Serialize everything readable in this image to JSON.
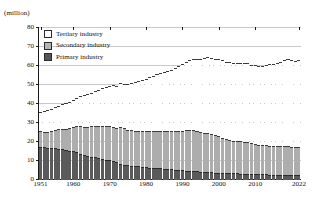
{
  "chart_data": {
    "type": "bar",
    "title": "",
    "subtitle": "",
    "xlabel": "",
    "ylabel": "(million)",
    "unit_label": "(million)",
    "stacked": true,
    "grid": true,
    "legend_position": "top-left",
    "ylim": [
      0,
      80
    ],
    "yticks": [
      0,
      10,
      20,
      30,
      40,
      50,
      60,
      70,
      80
    ],
    "xtick_labels": [
      "1951",
      "1960",
      "1970",
      "1980",
      "1990",
      "2000",
      "2010",
      "2022"
    ],
    "xtick_years": [
      1951,
      1960,
      1970,
      1980,
      1990,
      2000,
      2010,
      2022
    ],
    "xlim": [
      1951,
      2022
    ],
    "categories": [
      1951,
      1952,
      1953,
      1954,
      1955,
      1956,
      1957,
      1958,
      1959,
      1960,
      1961,
      1962,
      1963,
      1964,
      1965,
      1966,
      1967,
      1968,
      1969,
      1970,
      1971,
      1972,
      1973,
      1974,
      1975,
      1976,
      1977,
      1978,
      1979,
      1980,
      1981,
      1982,
      1983,
      1984,
      1985,
      1986,
      1987,
      1988,
      1989,
      1990,
      1991,
      1992,
      1993,
      1994,
      1995,
      1996,
      1997,
      1998,
      1999,
      2000,
      2001,
      2002,
      2003,
      2004,
      2005,
      2006,
      2007,
      2008,
      2009,
      2010,
      2011,
      2012,
      2013,
      2014,
      2015,
      2016,
      2017,
      2018,
      2019,
      2020,
      2021,
      2022
    ],
    "series": [
      {
        "name": "Primary industry",
        "color": "#5a5a5a",
        "values": [
          17.1,
          16.6,
          16.2,
          16.1,
          16.3,
          15.9,
          15.6,
          15.2,
          14.9,
          14.5,
          14.0,
          13.3,
          12.6,
          12.2,
          11.8,
          11.4,
          11.0,
          10.6,
          10.2,
          10.1,
          9.4,
          8.9,
          8.0,
          7.5,
          7.3,
          7.1,
          6.9,
          6.7,
          6.5,
          6.1,
          6.0,
          5.9,
          5.8,
          5.6,
          5.4,
          5.3,
          5.1,
          4.9,
          4.7,
          4.5,
          4.3,
          4.2,
          4.1,
          4.0,
          3.8,
          3.7,
          3.6,
          3.5,
          3.4,
          3.3,
          3.2,
          3.1,
          3.0,
          2.9,
          2.9,
          2.8,
          2.8,
          2.7,
          2.6,
          2.6,
          2.4,
          2.4,
          2.4,
          2.3,
          2.3,
          2.2,
          2.2,
          2.2,
          2.2,
          2.1,
          2.1,
          2.0
        ]
      },
      {
        "name": "Secondary industry",
        "color": "#adadad",
        "values": [
          8.0,
          8.4,
          8.8,
          9.2,
          9.5,
          10.2,
          10.9,
          11.3,
          11.9,
          12.8,
          13.7,
          14.5,
          15.0,
          15.4,
          15.9,
          16.4,
          17.0,
          17.5,
          17.9,
          18.0,
          18.1,
          18.0,
          19.2,
          19.1,
          18.6,
          18.5,
          18.5,
          18.6,
          18.8,
          19.1,
          19.2,
          19.3,
          19.6,
          19.7,
          19.8,
          19.9,
          20.0,
          20.3,
          20.6,
          20.9,
          21.6,
          21.8,
          21.6,
          21.1,
          20.7,
          20.5,
          20.4,
          20.1,
          19.6,
          19.1,
          18.5,
          18.0,
          17.6,
          17.2,
          17.1,
          17.0,
          16.9,
          16.8,
          16.2,
          15.9,
          15.6,
          15.4,
          15.3,
          15.3,
          15.1,
          15.1,
          15.1,
          15.2,
          15.1,
          15.0,
          14.9,
          14.9
        ]
      },
      {
        "name": "Tertiary industry",
        "color": "#ffffff",
        "values": [
          10.1,
          10.6,
          11.2,
          11.5,
          12.0,
          12.5,
          13.0,
          13.4,
          13.9,
          14.5,
          15.0,
          15.7,
          16.5,
          17.1,
          17.8,
          18.4,
          19.0,
          19.6,
          20.2,
          21.0,
          21.8,
          22.3,
          23.1,
          23.6,
          24.2,
          24.8,
          25.6,
          26.3,
          27.0,
          27.6,
          28.3,
          29.0,
          30.0,
          30.5,
          31.1,
          31.8,
          32.5,
          33.2,
          34.0,
          34.9,
          35.7,
          36.7,
          37.5,
          38.2,
          38.9,
          39.4,
          40.1,
          40.2,
          40.4,
          40.5,
          40.7,
          40.5,
          40.8,
          41.0,
          41.2,
          41.4,
          41.6,
          41.6,
          41.3,
          41.4,
          41.6,
          41.8,
          42.3,
          42.9,
          43.3,
          43.8,
          44.3,
          45.1,
          45.6,
          45.3,
          45.3,
          45.7
        ]
      }
    ],
    "totals": [
      35.2,
      35.6,
      36.2,
      36.8,
      37.8,
      38.6,
      39.5,
      39.9,
      40.7,
      41.8,
      42.7,
      43.5,
      44.1,
      44.7,
      45.5,
      46.2,
      47.0,
      47.7,
      48.3,
      49.1,
      49.3,
      49.2,
      50.3,
      50.2,
      50.1,
      50.4,
      51.0,
      51.6,
      52.3,
      52.8,
      53.5,
      54.2,
      55.4,
      55.8,
      56.3,
      57.0,
      57.6,
      58.4,
      59.3,
      60.3,
      61.6,
      62.7,
      63.2,
      63.3,
      63.4,
      63.6,
      64.1,
      63.8,
      63.4,
      62.9,
      62.4,
      61.6,
      61.4,
      61.1,
      61.2,
      61.2,
      61.3,
      61.1,
      60.1,
      59.9,
      59.6,
      59.6,
      60.0,
      60.5,
      60.7,
      61.1,
      61.6,
      62.5,
      62.9,
      62.4,
      62.3,
      62.6
    ]
  },
  "legend": {
    "items": [
      {
        "label": "Tertiary industry",
        "swatch": "tertiary-swatch"
      },
      {
        "label": "Secondary industry",
        "swatch": "secondary-swatch"
      },
      {
        "label": "Primary industry",
        "swatch": "primary-swatch"
      }
    ]
  }
}
